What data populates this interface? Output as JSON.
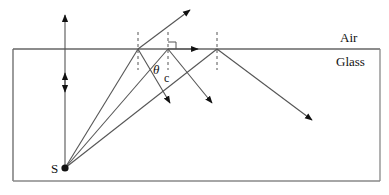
{
  "diagram": {
    "title": "",
    "labels": {
      "air": "Air",
      "glass": "Glass",
      "source": "S",
      "theta": "θ",
      "critical_subscript": "c"
    },
    "colors": {
      "line": "#555555",
      "arrow": "#111111",
      "text": "#111111",
      "background": "#ffffff"
    }
  }
}
